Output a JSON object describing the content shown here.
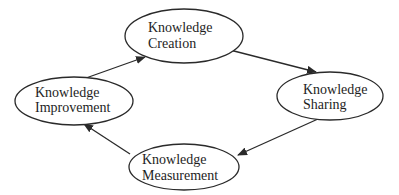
{
  "diagram": {
    "type": "cycle",
    "nodes": [
      {
        "id": "creation",
        "line1": "Knowledge",
        "line2": "Creation"
      },
      {
        "id": "sharing",
        "line1": "Knowledge",
        "line2": "Sharing"
      },
      {
        "id": "measurement",
        "line1": "Knowledge",
        "line2": "Measurement"
      },
      {
        "id": "improvement",
        "line1": "Knowledge",
        "line2": "Improvement"
      }
    ],
    "edges": [
      {
        "from": "creation",
        "to": "sharing"
      },
      {
        "from": "sharing",
        "to": "measurement"
      },
      {
        "from": "measurement",
        "to": "improvement"
      },
      {
        "from": "improvement",
        "to": "creation"
      }
    ],
    "colors": {
      "stroke": "#2a2a2a",
      "text": "#1e1e1e",
      "background": "#ffffff"
    }
  }
}
